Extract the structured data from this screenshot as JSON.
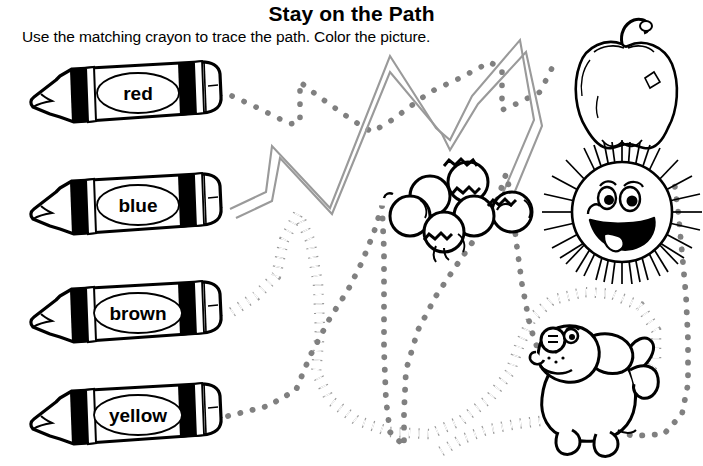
{
  "worksheet": {
    "title": "Stay on the Path",
    "instruction": "Use the matching crayon to trace the path.  Color the picture.",
    "page_width": 703,
    "page_height": 466,
    "background_color": "#ffffff",
    "ink_color": "#000000",
    "path_color": "#808080"
  },
  "crayons": [
    {
      "label": "red",
      "row": 1,
      "path_style": "dots",
      "connects_to": "apple"
    },
    {
      "label": "blue",
      "row": 2,
      "path_style": "double-line",
      "connects_to": "berries"
    },
    {
      "label": "brown",
      "row": 3,
      "path_style": "diamonds",
      "connects_to": "dog"
    },
    {
      "label": "yellow",
      "row": 4,
      "path_style": "dots",
      "connects_to": "sun"
    }
  ],
  "pictures": [
    {
      "name": "apple",
      "label": "apple"
    },
    {
      "name": "berries",
      "label": "berries"
    },
    {
      "name": "sun",
      "label": "smiling sun"
    },
    {
      "name": "dog",
      "label": "puppy"
    }
  ]
}
